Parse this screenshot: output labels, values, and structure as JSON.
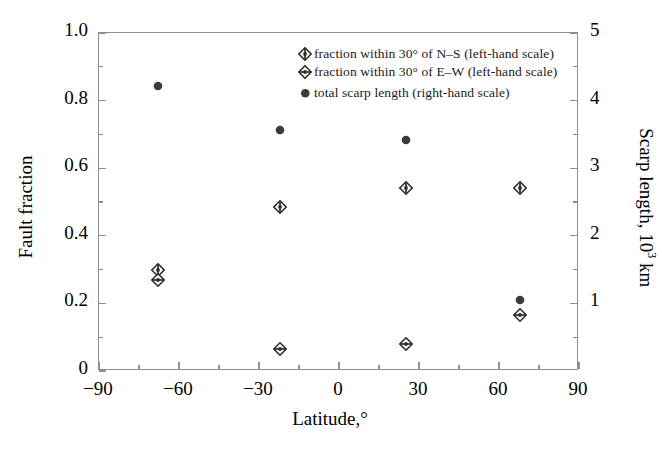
{
  "chart_data": {
    "type": "scatter",
    "title": "",
    "xlabel": "Latitude,°",
    "ylabel": "Fault fraction",
    "ylabel_right": "Scarp length, 10",
    "ylabel_right_sup": "3",
    "ylabel_right_unit": " km",
    "xlim": [
      -90,
      90
    ],
    "ylim": [
      0,
      1.0
    ],
    "ylim_right": [
      0,
      5
    ],
    "grid": false,
    "legend_position": "top-right",
    "xticks": [
      "-90",
      "-60",
      "-30",
      "0",
      "30",
      "60",
      "90"
    ],
    "xtick_values": [
      -90,
      -60,
      -30,
      0,
      30,
      60,
      90
    ],
    "yticks_left": [
      "0",
      "0.2",
      "0.4",
      "0.6",
      "0.8",
      "1.0"
    ],
    "ytick_left_values": [
      0,
      0.2,
      0.4,
      0.6,
      0.8,
      1.0
    ],
    "yticks_right": [
      "0",
      "1",
      "2",
      "3",
      "4",
      "5"
    ],
    "ytick_right_values": [
      0,
      1,
      2,
      3,
      4,
      5
    ],
    "series": [
      {
        "name": "fraction within 30° of N–S (left-hand scale)",
        "marker": "diamond-vertical-bar",
        "axis": "left",
        "points": [
          {
            "x": -68,
            "y": 0.3
          },
          {
            "x": -22,
            "y": 0.485
          },
          {
            "x": 25,
            "y": 0.54
          },
          {
            "x": 68,
            "y": 0.54
          }
        ]
      },
      {
        "name": "fraction within 30° of E–W (left-hand scale)",
        "marker": "diamond-horizontal-bar",
        "axis": "left",
        "points": [
          {
            "x": -68,
            "y": 0.27
          },
          {
            "x": -22,
            "y": 0.065
          },
          {
            "x": 25,
            "y": 0.08
          },
          {
            "x": 68,
            "y": 0.165
          }
        ]
      },
      {
        "name": "total scarp length (right-hand scale)",
        "marker": "filled-circle",
        "axis": "right",
        "points": [
          {
            "x": -68,
            "y": 4.22
          },
          {
            "x": -22,
            "y": 3.57
          },
          {
            "x": 25,
            "y": 3.42
          },
          {
            "x": 68,
            "y": 1.05
          }
        ]
      }
    ],
    "legend": [
      "fraction within 30° of N–S (left-hand scale)",
      "fraction within 30° of E–W (left-hand scale)",
      "total scarp length (right-hand scale)"
    ],
    "colors": {
      "frame": "#8e8e8e",
      "marker_fill": "#3a3a3a",
      "marker_stroke": "#2b2b2b",
      "text": "#000000"
    }
  }
}
